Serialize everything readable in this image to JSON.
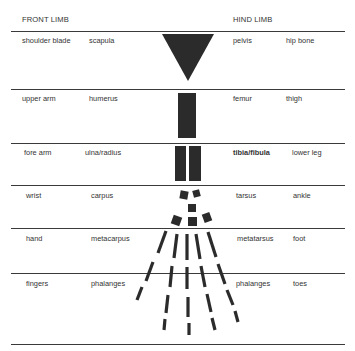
{
  "header": {
    "front_limb": "FRONT LIMB",
    "hind_limb": "HIND LIMB"
  },
  "rows": [
    {
      "front_common": "shoulder blade",
      "front_bone": "scapula",
      "hind_bone": "pelvis",
      "hind_common": "hip bone",
      "shape": "triangle"
    },
    {
      "front_common": "upper arm",
      "front_bone": "humerus",
      "hind_bone": "femur",
      "hind_common": "thigh",
      "shape": "single-bar"
    },
    {
      "front_common": "fore arm",
      "front_bone": "ulna/radius",
      "hind_bone": "tibia/fibula",
      "hind_common": "lower leg",
      "shape": "double-bar"
    },
    {
      "front_common": "wrist",
      "front_bone": "carpus",
      "hind_bone": "tarsus",
      "hind_common": "ankle",
      "shape": "small-blocks"
    },
    {
      "front_common": "hand",
      "front_bone": "metacarpus",
      "hind_bone": "metatarsus",
      "hind_common": "foot",
      "shape": "long-rays"
    },
    {
      "front_common": "fingers",
      "front_bone": "phalanges",
      "hind_bone": "phalanges",
      "hind_common": "toes",
      "shape": "dashed-rays"
    }
  ],
  "colors": {
    "bone_fill": "#2b2b2b",
    "rule": "#3a3a3a",
    "text": "#333333"
  }
}
